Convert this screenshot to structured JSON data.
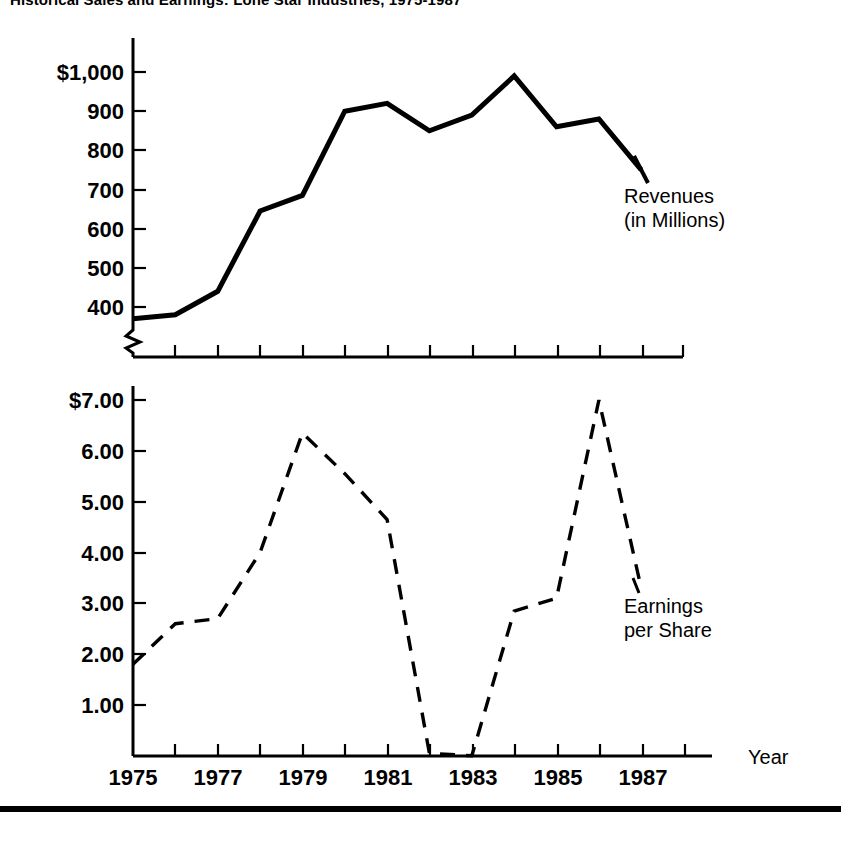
{
  "figure": {
    "title": "Historical Sales and Earnings: Lone Star Industries, 1975-1987",
    "bottom_rule": true
  },
  "annotations": {
    "revenue_label_line1": "Revenues",
    "revenue_label_line2": "(in Millions)",
    "eps_label_line1": "Earnings",
    "eps_label_line2": "per Share",
    "x_axis_name": "Year"
  },
  "colors": {
    "ink": "#000000",
    "paper": "#ffffff"
  },
  "chart_data": [
    {
      "type": "line",
      "id": "revenues",
      "title": "Revenues (in Millions)",
      "xlabel": "Year",
      "ylabel": "",
      "x": [
        1975,
        1976,
        1977,
        1978,
        1979,
        1980,
        1981,
        1982,
        1983,
        1984,
        1985,
        1986,
        1987
      ],
      "values": [
        370,
        380,
        440,
        645,
        685,
        900,
        920,
        850,
        890,
        990,
        860,
        880,
        750
      ],
      "ytick_labels": [
        "$1,000",
        "900",
        "800",
        "700",
        "600",
        "500",
        "400"
      ],
      "ytick_values": [
        1000,
        900,
        800,
        700,
        600,
        500,
        400
      ],
      "ylim": [
        330,
        1040
      ],
      "xlim": [
        1975,
        1988
      ],
      "xtick_values": [
        1975,
        1976,
        1977,
        1978,
        1979,
        1980,
        1981,
        1982,
        1983,
        1984,
        1985,
        1986,
        1987
      ],
      "axis_break": true,
      "grid": false,
      "linestyle": "solid",
      "legend": "inline-annotation"
    },
    {
      "type": "line",
      "id": "earnings_per_share",
      "title": "Earnings per Share",
      "xlabel": "Year",
      "ylabel": "",
      "x": [
        1975,
        1976,
        1977,
        1978,
        1979,
        1980,
        1981,
        1982,
        1983,
        1984,
        1985,
        1986,
        1987
      ],
      "values": [
        1.8,
        2.6,
        2.7,
        4.0,
        6.35,
        5.55,
        4.65,
        0.05,
        0.0,
        2.85,
        3.1,
        7.0,
        3.3
      ],
      "ytick_labels": [
        "$7.00",
        "6.00",
        "5.00",
        "4.00",
        "3.00",
        "2.00",
        "1.00"
      ],
      "ytick_values": [
        7.0,
        6.0,
        5.0,
        4.0,
        3.0,
        2.0,
        1.0
      ],
      "ylim": [
        0,
        7.3
      ],
      "xlim": [
        1975,
        1988
      ],
      "xtick_values": [
        1975,
        1976,
        1977,
        1978,
        1979,
        1980,
        1981,
        1982,
        1983,
        1984,
        1985,
        1986,
        1987,
        1988
      ],
      "xtick_labels_shown": [
        "1975",
        "1977",
        "1979",
        "1981",
        "1983",
        "1985",
        "1987"
      ],
      "grid": false,
      "linestyle": "dashed",
      "legend": "inline-annotation"
    }
  ],
  "xaxis": {
    "labels": [
      {
        "text": "1975",
        "year": 1975
      },
      {
        "text": "1977",
        "year": 1977
      },
      {
        "text": "1979",
        "year": 1979
      },
      {
        "text": "1981",
        "year": 1981
      },
      {
        "text": "1983",
        "year": 1983
      },
      {
        "text": "1985",
        "year": 1985
      },
      {
        "text": "1987",
        "year": 1987
      }
    ]
  }
}
